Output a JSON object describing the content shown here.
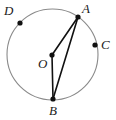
{
  "figure": {
    "type": "circle-geometry-diagram",
    "background_color": "#ffffff",
    "circle": {
      "name": "circle-O",
      "center": {
        "x": 52.5,
        "y": 54.5,
        "label": "O"
      },
      "radius": 45.5,
      "stroke_color": "#8a8a8a",
      "stroke_width": 1.1,
      "fill": "none"
    },
    "points": [
      {
        "id": "A",
        "label": "A",
        "x": 78,
        "y": 17,
        "on_circle": true,
        "dot_color": "#111111",
        "dot_radius": 2.6,
        "label_x": 82,
        "label_y": 2
      },
      {
        "id": "B",
        "label": "B",
        "x": 53,
        "y": 99,
        "on_circle": true,
        "dot_color": "#111111",
        "dot_radius": 2.6,
        "label_x": 49,
        "label_y": 104
      },
      {
        "id": "C",
        "label": "C",
        "x": 95,
        "y": 45,
        "on_circle": true,
        "dot_color": "#111111",
        "dot_radius": 2.6,
        "label_x": 101,
        "label_y": 38
      },
      {
        "id": "D",
        "label": "D",
        "x": 20,
        "y": 23,
        "on_circle": true,
        "dot_color": "#111111",
        "dot_radius": 2.6,
        "label_x": 4,
        "label_y": 4
      },
      {
        "id": "O",
        "label": "O",
        "x": 52,
        "y": 55,
        "on_circle": false,
        "dot_color": "#111111",
        "dot_radius": 2.6,
        "label_x": 38,
        "label_y": 57
      }
    ],
    "segments": [
      {
        "id": "OA",
        "name": "radius-O-A",
        "from": "O",
        "to": "A",
        "x1": 52,
        "y1": 55,
        "x2": 78,
        "y2": 17,
        "stroke_color": "#111111",
        "stroke_width": 1.6
      },
      {
        "id": "OB",
        "name": "radius-O-B",
        "from": "O",
        "to": "B",
        "x1": 52,
        "y1": 55,
        "x2": 53,
        "y2": 99,
        "stroke_color": "#111111",
        "stroke_width": 1.6
      },
      {
        "id": "AB",
        "name": "chord-A-B",
        "from": "A",
        "to": "B",
        "x1": 78,
        "y1": 17,
        "x2": 53,
        "y2": 99,
        "stroke_color": "#111111",
        "stroke_width": 1.6
      }
    ],
    "labels": {
      "A": "A",
      "B": "B",
      "C": "C",
      "D": "D",
      "O": "O"
    }
  }
}
